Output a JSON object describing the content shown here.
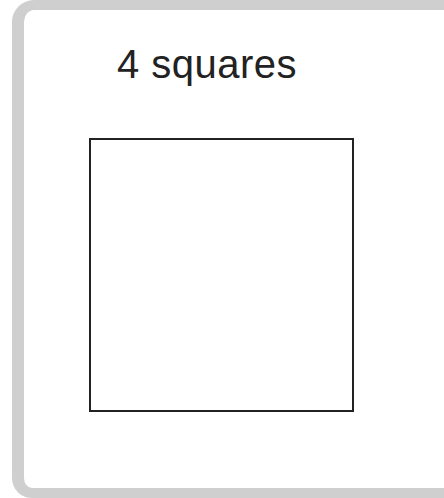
{
  "card": {
    "title": "4 squares",
    "shape": "square-outline",
    "colors": {
      "border": "#cfcfcf",
      "stroke": "#222222",
      "background": "#ffffff"
    }
  }
}
